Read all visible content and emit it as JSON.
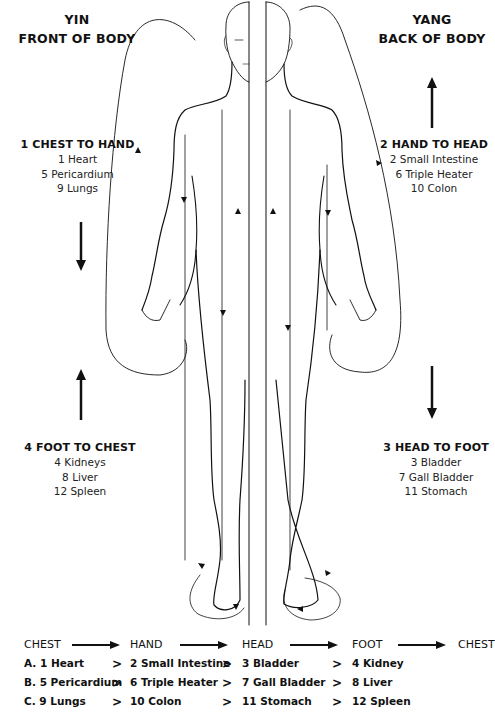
{
  "left_header": {
    "line1": "YIN",
    "line2": "FRONT OF BODY"
  },
  "right_header": {
    "line1": "YANG",
    "line2": "BACK OF BODY"
  },
  "groups": {
    "g1": {
      "title": "1 CHEST TO HAND",
      "items": [
        "1 Heart",
        "5 Pericardium",
        "9 Lungs"
      ],
      "arrow": "down"
    },
    "g2": {
      "title": "2 HAND TO HEAD",
      "items": [
        "2 Small Intestine",
        "6 Triple Heater",
        "10 Colon"
      ],
      "arrow": "up"
    },
    "g3": {
      "title": "3 HEAD TO FOOT",
      "items": [
        "3 Bladder",
        "7 Gall Bladder",
        "11 Stomach"
      ],
      "arrow": "down"
    },
    "g4": {
      "title": "4 FOOT TO CHEST",
      "items": [
        "4 Kidneys",
        "8 Liver",
        "12 Spleen"
      ],
      "arrow": "up"
    }
  },
  "flow_table": {
    "header": [
      "CHEST",
      "HAND",
      "HEAD",
      "FOOT",
      "CHEST"
    ],
    "separator": ">",
    "rows": [
      [
        "A. 1 Heart",
        "2 Small Intestine",
        "3 Bladder",
        "4 Kidney"
      ],
      [
        "B. 5 Pericardium",
        "6 Triple Heater",
        "7 Gall Bladder",
        "8 Liver"
      ],
      [
        "C. 9 Lungs",
        "10 Colon",
        "11 Stomach",
        "12 Spleen"
      ]
    ]
  },
  "colors": {
    "ink": "#111111",
    "background": "#ffffff"
  }
}
